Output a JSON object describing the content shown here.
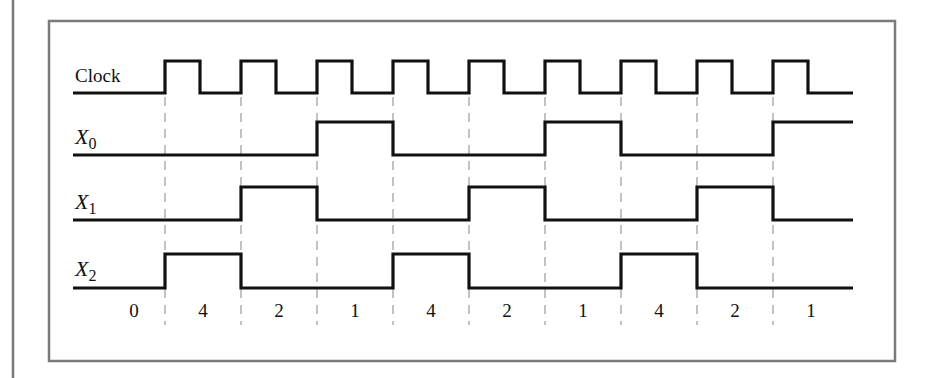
{
  "diagram": {
    "type": "timing-diagram",
    "colors": {
      "frame": "#7a7a7a",
      "signal": "#111111",
      "dash": "#9a9a9a",
      "background": "#ffffff"
    },
    "signals": [
      {
        "id": "clock",
        "label": "Clock",
        "subscript": ""
      },
      {
        "id": "x0",
        "label": "X",
        "subscript": "0"
      },
      {
        "id": "x1",
        "label": "X",
        "subscript": "1"
      },
      {
        "id": "x2",
        "label": "X",
        "subscript": "2"
      }
    ],
    "edges_x": [
      165,
      241,
      317,
      393,
      469,
      545,
      621,
      697,
      773
    ],
    "waveforms": {
      "clock": "pulse train: 9 rising edges, high for ~46% of period",
      "x0": [
        0,
        0,
        0,
        1,
        0,
        0,
        1,
        0,
        0,
        1
      ],
      "x1": [
        0,
        0,
        1,
        0,
        0,
        1,
        0,
        0,
        1,
        0
      ],
      "x2": [
        0,
        1,
        0,
        0,
        1,
        0,
        0,
        1,
        0,
        0
      ]
    },
    "states": [
      "0",
      "4",
      "2",
      "1",
      "4",
      "2",
      "1",
      "4",
      "2",
      "1"
    ]
  }
}
